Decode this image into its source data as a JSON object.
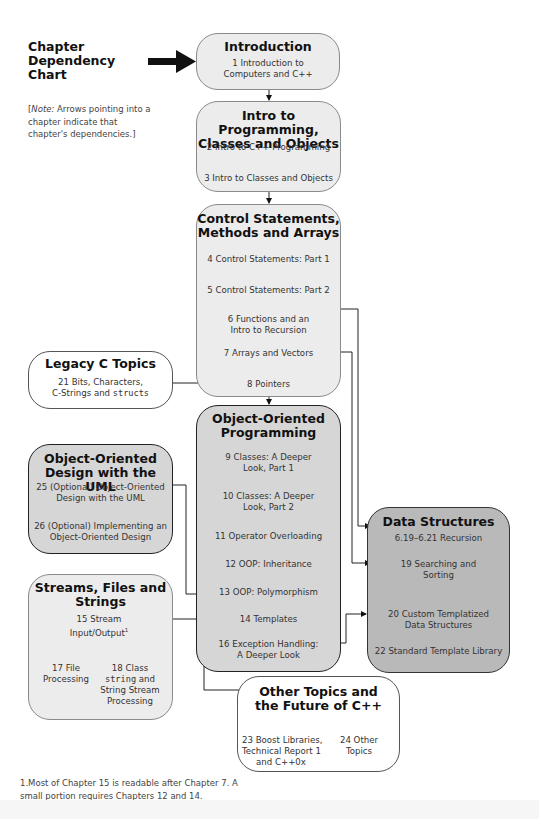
{
  "header": {
    "title_lines": [
      "Chapter",
      "Dependency",
      "Chart"
    ],
    "note_italic": "Note:",
    "note_text": "Arrows pointing into a chapter indicate that chapter's dependencies.]",
    "note_open": "["
  },
  "boxes": {
    "introduction": {
      "title": "Introduction",
      "chapters": [
        {
          "line1": "1 Introduction to",
          "line2": "Computers and C++"
        }
      ]
    },
    "intro_programming": {
      "title_line1": "Intro to Programming,",
      "title_line2": "Classes and Objects",
      "chapters": [
        "2 Intro to C++ Programming",
        "3 Intro to Classes and Objects"
      ]
    },
    "control_statements": {
      "title_line1": "Control Statements,",
      "title_line2": "Methods and Arrays",
      "chapters": [
        {
          "line1": "4 Control Statements: Part 1"
        },
        {
          "line1": "5 Control Statements: Part 2"
        },
        {
          "line1": "6 Functions and an",
          "line2": "Intro to Recursion"
        },
        {
          "line1": "7 Arrays and Vectors"
        },
        {
          "line1": "8 Pointers"
        }
      ]
    },
    "legacy_c": {
      "title": "Legacy C Topics",
      "chapter_line1": "21 Bits, Characters,",
      "chapter_line2_prefix": "C-Strings and ",
      "chapter_line2_code": "structs"
    },
    "oop": {
      "title_line1": "Object-Oriented",
      "title_line2": "Programming",
      "chapters": [
        {
          "line1": "9 Classes: A Deeper",
          "line2": "Look, Part 1"
        },
        {
          "line1": "10 Classes: A Deeper",
          "line2": "Look, Part 2"
        },
        {
          "line1": "11 Operator Overloading"
        },
        {
          "line1": "12 OOP: Inheritance"
        },
        {
          "line1": "13 OOP: Polymorphism"
        },
        {
          "line1": "14 Templates"
        },
        {
          "line1": "16 Exception Handling:",
          "line2": "A Deeper Look"
        }
      ]
    },
    "ood_uml": {
      "title_line1": "Object-Oriented",
      "title_line2": "Design with the UML",
      "chapters": [
        {
          "line1": "25 (Optional) Object-Oriented",
          "line2": "Design with the UML"
        },
        {
          "line1": "26 (Optional) Implementing an",
          "line2": "Object-Oriented Design"
        }
      ]
    },
    "streams": {
      "title_line1": "Streams, Files and",
      "title_line2": "Strings",
      "ch15_line1": "15 Stream",
      "ch15_line2": "Input/Output",
      "ch15_sup": "1",
      "ch17_line1": "17 File",
      "ch17_line2": "Processing",
      "ch18_line1": "18 Class",
      "ch18_code": "string",
      "ch18_line2_suffix": " and",
      "ch18_line3": "String Stream",
      "ch18_line4": "Processing"
    },
    "data_structures": {
      "title": "Data Structures",
      "chapters": [
        {
          "line1": "6.19–6.21 Recursion"
        },
        {
          "line1": "19 Searching and",
          "line2": "Sorting"
        },
        {
          "line1": "20 Custom Templatized",
          "line2": "Data Structures"
        },
        {
          "line1": "22 Standard Template Library"
        }
      ]
    },
    "other_topics": {
      "title_line1": "Other Topics and",
      "title_line2": "the Future of C++",
      "ch23_line1": "23 Boost Libraries,",
      "ch23_line2": "Technical Report 1",
      "ch23_line3": "and C++0x",
      "ch24_line1": "24 Other",
      "ch24_line2": "Topics"
    }
  },
  "footnote": {
    "line1": "1.Most of Chapter 15 is readable after Chapter 7. A",
    "line2": "small portion requires Chapters 12 and 14."
  },
  "colors": {
    "light_box": "#ececec",
    "mid_box": "#d6d6d6",
    "dark_box": "#b9b9b9",
    "white_box": "#ffffff",
    "arrow": "#111111"
  }
}
